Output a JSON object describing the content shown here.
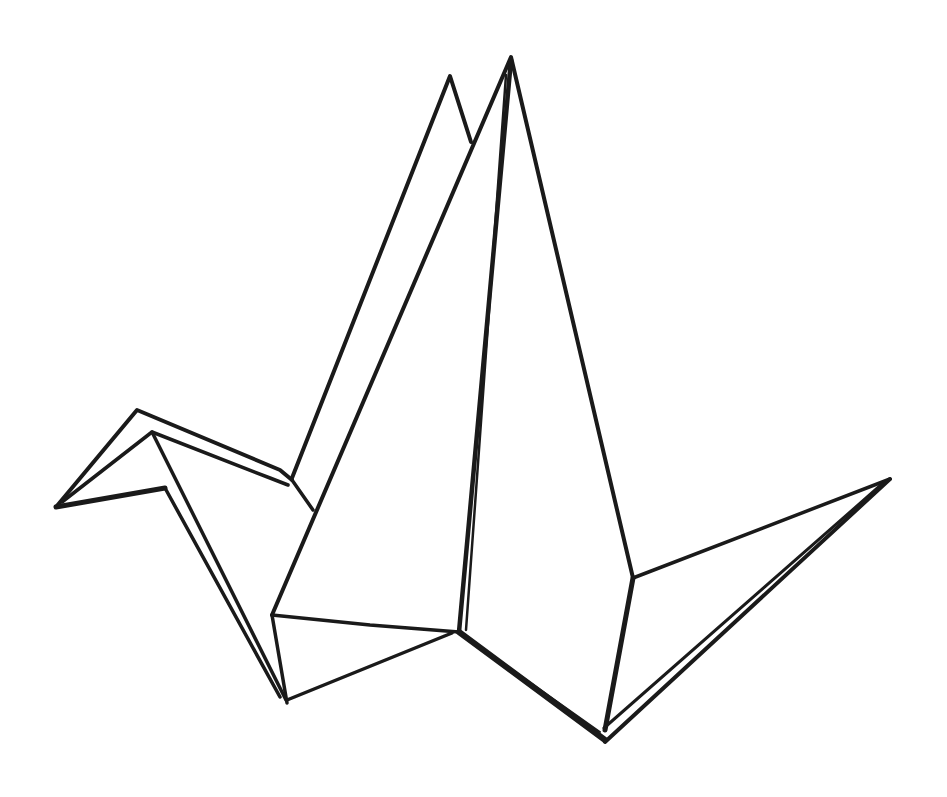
{
  "image": {
    "subject": "Origami paper crane line drawing",
    "style": "black ink outline on white background",
    "colors": {
      "background": "#ffffff",
      "ink": "#1a1a1a"
    }
  }
}
